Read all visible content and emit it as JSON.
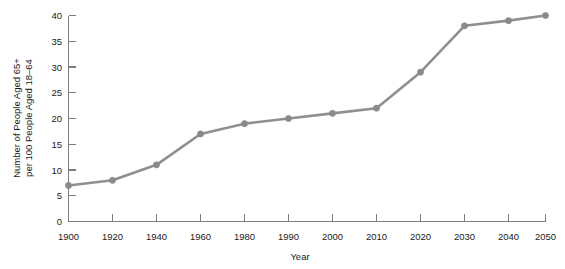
{
  "chart_data": {
    "type": "line",
    "title": "",
    "xlabel": "Year",
    "ylabel": "Number of People Aged 65+ per 100 People Aged 18–64",
    "ylabel_line1": "Number of People Aged 65+",
    "ylabel_line2": "per 100 People Aged 18–64",
    "categories": [
      "1900",
      "1920",
      "1940",
      "1960",
      "1980",
      "1990",
      "2000",
      "2010",
      "2020",
      "2030",
      "2040",
      "2050"
    ],
    "values": [
      7,
      8,
      11,
      17,
      19,
      20,
      21,
      22,
      29,
      38,
      39,
      40
    ],
    "xtick_labels": [
      "1900",
      "1920",
      "1940",
      "1960",
      "1980",
      "1990",
      "2000",
      "2010",
      "2020",
      "2030",
      "2040",
      "2050"
    ],
    "ytick_labels": [
      "0",
      "5",
      "10",
      "15",
      "20",
      "25",
      "30",
      "35",
      "40"
    ],
    "ytick_values": [
      0,
      5,
      10,
      15,
      20,
      25,
      30,
      35,
      40
    ],
    "ylim": [
      0,
      40
    ],
    "grid": false,
    "legend": false,
    "legend_position": "none",
    "x_spacing": "categorical-equal",
    "series": [
      {
        "name": "Old-age dependency ratio",
        "values": [
          7,
          8,
          11,
          17,
          19,
          20,
          21,
          22,
          29,
          38,
          39,
          40
        ]
      }
    ],
    "colors": {
      "line": "#8f8f8f",
      "marker": "#8a8a8a",
      "axis": "#7d7d7d",
      "text": "#1a1a1a",
      "background": "#ffffff"
    }
  }
}
